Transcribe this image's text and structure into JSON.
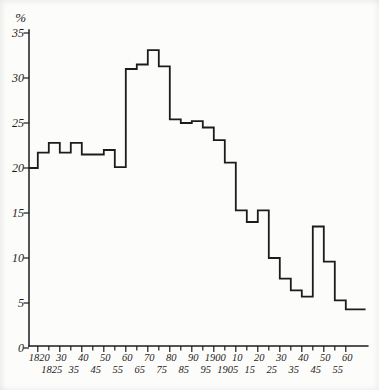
{
  "page": {
    "background": "#fcfcfa",
    "ink": "#1c1c1c"
  },
  "chart_data": {
    "type": "line",
    "subtype": "step_histogram_outline",
    "title": "",
    "xlabel": "",
    "ylabel": "%",
    "grid": false,
    "legend": false,
    "ylim": [
      0,
      35
    ],
    "yticks": [
      0,
      5,
      10,
      15,
      20,
      25,
      30,
      35
    ],
    "x_unit": "year",
    "x_start": 1816,
    "x_axis_end_year": 1970,
    "xticks_minor_step": 5,
    "xticks_minor_from": 1820,
    "xticks_minor_to": 1960,
    "xtick_rows": {
      "row1": {
        "years": [
          1820,
          1830,
          1840,
          1850,
          1860,
          1870,
          1880,
          1890,
          1900,
          1910,
          1920,
          1930,
          1940,
          1950,
          1960
        ],
        "labels": [
          "1820",
          "30",
          "40",
          "50",
          "60",
          "70",
          "80",
          "90",
          "1900",
          "10",
          "20",
          "30",
          "40",
          "50",
          "60"
        ]
      },
      "row2": {
        "years": [
          1825,
          1835,
          1845,
          1855,
          1865,
          1875,
          1885,
          1895,
          1905,
          1915,
          1925,
          1935,
          1945,
          1955
        ],
        "labels": [
          "1825",
          "35",
          "45",
          "55",
          "65",
          "75",
          "85",
          "95",
          "1905",
          "15",
          "25",
          "35",
          "45",
          "55"
        ]
      }
    },
    "series": [
      {
        "from": 1816,
        "to": 1820,
        "value": 20.0
      },
      {
        "from": 1820,
        "to": 1825,
        "value": 21.7
      },
      {
        "from": 1825,
        "to": 1830,
        "value": 22.8
      },
      {
        "from": 1830,
        "to": 1835,
        "value": 21.7
      },
      {
        "from": 1835,
        "to": 1840,
        "value": 22.8
      },
      {
        "from": 1840,
        "to": 1845,
        "value": 21.5
      },
      {
        "from": 1845,
        "to": 1850,
        "value": 21.5
      },
      {
        "from": 1850,
        "to": 1855,
        "value": 22.0
      },
      {
        "from": 1855,
        "to": 1860,
        "value": 20.1
      },
      {
        "from": 1860,
        "to": 1865,
        "value": 31.0
      },
      {
        "from": 1865,
        "to": 1870,
        "value": 31.5
      },
      {
        "from": 1870,
        "to": 1875,
        "value": 33.1
      },
      {
        "from": 1875,
        "to": 1880,
        "value": 31.3
      },
      {
        "from": 1880,
        "to": 1885,
        "value": 25.4
      },
      {
        "from": 1885,
        "to": 1890,
        "value": 25.0
      },
      {
        "from": 1890,
        "to": 1895,
        "value": 25.2
      },
      {
        "from": 1895,
        "to": 1900,
        "value": 24.5
      },
      {
        "from": 1900,
        "to": 1905,
        "value": 23.1
      },
      {
        "from": 1905,
        "to": 1910,
        "value": 20.6
      },
      {
        "from": 1910,
        "to": 1915,
        "value": 15.3
      },
      {
        "from": 1915,
        "to": 1920,
        "value": 14.0
      },
      {
        "from": 1920,
        "to": 1925,
        "value": 15.3
      },
      {
        "from": 1925,
        "to": 1930,
        "value": 10.0
      },
      {
        "from": 1930,
        "to": 1935,
        "value": 7.7
      },
      {
        "from": 1935,
        "to": 1940,
        "value": 6.4
      },
      {
        "from": 1940,
        "to": 1945,
        "value": 5.7
      },
      {
        "from": 1945,
        "to": 1950,
        "value": 13.5
      },
      {
        "from": 1950,
        "to": 1955,
        "value": 9.6
      },
      {
        "from": 1955,
        "to": 1960,
        "value": 5.3
      },
      {
        "from": 1960,
        "to": 1969,
        "value": 4.3
      }
    ]
  }
}
